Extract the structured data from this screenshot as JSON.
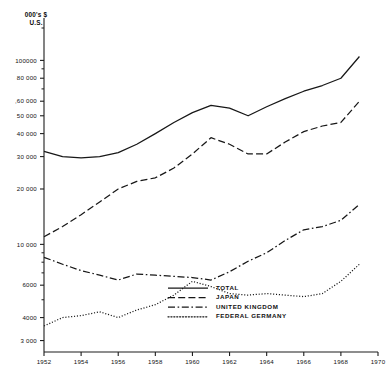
{
  "chart_data": {
    "type": "line",
    "title": "",
    "ylabel": "000's $ U.S.",
    "xlabel": "",
    "yscale": "log",
    "ylim": [
      2600,
      150000
    ],
    "xlim": [
      1952,
      1970
    ],
    "grid": false,
    "legend_position": "bottom-center",
    "y_ticks": [
      3000,
      4000,
      6000,
      10000,
      20000,
      30000,
      40000,
      50000,
      60000,
      80000,
      100000
    ],
    "y_tick_labels": [
      "3 000",
      "4000",
      "6000",
      "10 000",
      "20 000",
      "30 000",
      "40 000",
      "50 000",
      ",60 000",
      "80 000",
      "100000"
    ],
    "x_ticks": [
      1952,
      1954,
      1956,
      1958,
      1960,
      1962,
      1964,
      1966,
      1968,
      1970
    ],
    "x_tick_labels": [
      "1952",
      "1954",
      "1956",
      "1958",
      "1960",
      "1962",
      "1964",
      "1966",
      "1968",
      "1970"
    ],
    "x": [
      1952,
      1953,
      1954,
      1955,
      1956,
      1957,
      1958,
      1959,
      1960,
      1961,
      1962,
      1963,
      1964,
      1965,
      1966,
      1967,
      1968,
      1969
    ],
    "series": [
      {
        "name": "TOTAL",
        "dash": "none",
        "values": [
          32000,
          30000,
          29500,
          30000,
          31500,
          35000,
          40000,
          46000,
          52000,
          57000,
          55000,
          50000,
          56000,
          62000,
          68000,
          73000,
          80000,
          105000
        ]
      },
      {
        "name": "JAPAN",
        "dash": "dashed",
        "values": [
          11000,
          12500,
          14500,
          17000,
          20000,
          22000,
          23000,
          26000,
          31000,
          38000,
          35000,
          31000,
          31000,
          36000,
          41000,
          44000,
          46000,
          60000
        ]
      },
      {
        "name": "UNITED KINGDOM",
        "dash": "dashdot",
        "values": [
          8500,
          7800,
          7200,
          6800,
          6400,
          6900,
          6800,
          6700,
          6600,
          6400,
          7100,
          8100,
          9000,
          10500,
          12000,
          12500,
          13500,
          16500
        ]
      },
      {
        "name": "FEDERAL GERMANY",
        "dash": "dotted",
        "values": [
          3600,
          4000,
          4100,
          4300,
          4000,
          4400,
          4700,
          5300,
          6300,
          5900,
          5400,
          5300,
          5400,
          5300,
          5200,
          5400,
          6300,
          7800
        ]
      }
    ]
  },
  "legend": {
    "items": [
      {
        "label": "TOTAL"
      },
      {
        "label": "JAPAN"
      },
      {
        "label": "UNITED KINGDOM"
      },
      {
        "label": "FEDERAL GERMANY"
      }
    ]
  },
  "axis": {
    "y_title_line1": "000's $",
    "y_title_line2": "U.S."
  }
}
